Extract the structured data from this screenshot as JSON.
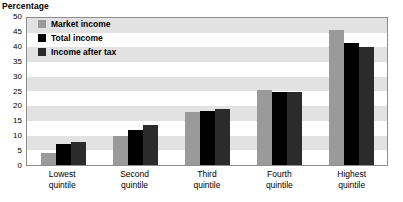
{
  "chart_data": {
    "type": "bar",
    "title": "Percentage",
    "xlabel": "",
    "ylabel": "Percentage",
    "ylim": [
      0,
      50
    ],
    "yticks": [
      50,
      45,
      40,
      35,
      30,
      25,
      20,
      15,
      10,
      5,
      0
    ],
    "grid": "horizontal-alternating-bands",
    "legend_position": "top-left-inside",
    "categories": [
      "Lowest quintile",
      "Second quintile",
      "Third quintile",
      "Fourth quintile",
      "Highest quintile"
    ],
    "category_lines": [
      [
        "Lowest",
        "quintile"
      ],
      [
        "Second",
        "quintile"
      ],
      [
        "Third",
        "quintile"
      ],
      [
        "Fourth",
        "quintile"
      ],
      [
        "Highest",
        "quintile"
      ]
    ],
    "series": [
      {
        "name": "Market income",
        "color": "#9a9a9a",
        "values": [
          4.0,
          10.0,
          18.0,
          25.5,
          46.0
        ]
      },
      {
        "name": "Total income",
        "color": "#000000",
        "values": [
          7.0,
          12.0,
          18.5,
          24.8,
          41.5
        ]
      },
      {
        "name": "Income after tax",
        "color": "#2b2b2b",
        "values": [
          7.8,
          13.5,
          19.0,
          24.8,
          40.0
        ]
      }
    ]
  },
  "colors": {
    "market_income": "#9a9a9a",
    "total_income": "#000000",
    "income_after_tax": "#2b2b2b",
    "band": "#e2e2e2",
    "frame": "#8d8d8d"
  }
}
